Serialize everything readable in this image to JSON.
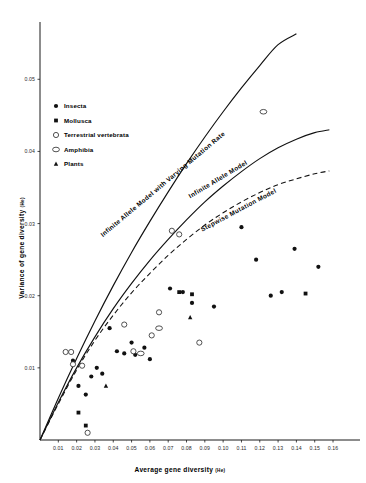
{
  "figure": {
    "background": "#ffffff",
    "ink": "#111111"
  },
  "chart_data": {
    "type": "scatter",
    "title": "",
    "xlabel": "Average gene diversity",
    "xlabel_sub": "(He)",
    "ylabel": "Variance of gene diversity",
    "ylabel_sub": "(He)",
    "xlim": [
      0.0,
      0.172
    ],
    "ylim": [
      0.0,
      0.056
    ],
    "grid": false,
    "xticks": [
      "0.01",
      "0.02",
      "0.03",
      "0.04",
      "0.05",
      "0.06",
      "0.07",
      "0.08",
      "0.09",
      "0.10",
      "0.11",
      "0.12",
      "0.13",
      "0.14",
      "0.15",
      "0.16"
    ],
    "xtick_values": [
      0.01,
      0.02,
      0.03,
      0.04,
      0.05,
      0.06,
      0.07,
      0.08,
      0.09,
      0.1,
      0.11,
      0.12,
      0.13,
      0.14,
      0.15,
      0.16
    ],
    "yticks": [
      "0.01",
      "0.02",
      "0.03",
      "0.04",
      "0.05"
    ],
    "ytick_values": [
      0.01,
      0.02,
      0.03,
      0.04,
      0.05
    ],
    "legend_position": "upper-left",
    "legend": [
      {
        "label": "Insecta",
        "marker": "filled-circle"
      },
      {
        "label": "Mollusca",
        "marker": "filled-square"
      },
      {
        "label": "Terrestrial vertebrata",
        "marker": "open-circle"
      },
      {
        "label": "Amphibia",
        "marker": "open-ellipse"
      },
      {
        "label": "Plants",
        "marker": "filled-triangle"
      }
    ],
    "series": [
      {
        "name": "Insecta",
        "marker": "filled-circle",
        "points": [
          [
            0.018,
            0.011
          ],
          [
            0.021,
            0.0075
          ],
          [
            0.025,
            0.0063
          ],
          [
            0.028,
            0.0088
          ],
          [
            0.031,
            0.01
          ],
          [
            0.034,
            0.0092
          ],
          [
            0.038,
            0.0155
          ],
          [
            0.042,
            0.0123
          ],
          [
            0.046,
            0.012
          ],
          [
            0.05,
            0.0135
          ],
          [
            0.052,
            0.0118
          ],
          [
            0.057,
            0.0128
          ],
          [
            0.06,
            0.0112
          ],
          [
            0.071,
            0.021
          ],
          [
            0.078,
            0.0205
          ],
          [
            0.083,
            0.019
          ],
          [
            0.095,
            0.0185
          ],
          [
            0.11,
            0.0295
          ],
          [
            0.118,
            0.025
          ],
          [
            0.126,
            0.02
          ],
          [
            0.132,
            0.0205
          ],
          [
            0.139,
            0.0265
          ],
          [
            0.152,
            0.024
          ]
        ]
      },
      {
        "name": "Mollusca",
        "marker": "filled-square",
        "points": [
          [
            0.021,
            0.0038
          ],
          [
            0.025,
            0.002
          ],
          [
            0.076,
            0.0205
          ],
          [
            0.083,
            0.0202
          ],
          [
            0.145,
            0.0203
          ]
        ]
      },
      {
        "name": "Terrestrial vertebrata",
        "marker": "open-circle",
        "points": [
          [
            0.014,
            0.0122
          ],
          [
            0.017,
            0.0122
          ],
          [
            0.018,
            0.0105
          ],
          [
            0.023,
            0.0103
          ],
          [
            0.026,
            0.001
          ],
          [
            0.046,
            0.016
          ],
          [
            0.051,
            0.0123
          ],
          [
            0.061,
            0.0145
          ],
          [
            0.065,
            0.0177
          ],
          [
            0.072,
            0.029
          ],
          [
            0.076,
            0.0285
          ],
          [
            0.087,
            0.0135
          ]
        ]
      },
      {
        "name": "Amphibia",
        "marker": "open-ellipse",
        "points": [
          [
            0.055,
            0.012
          ],
          [
            0.065,
            0.0155
          ],
          [
            0.122,
            0.0455
          ]
        ]
      },
      {
        "name": "Plants",
        "marker": "filled-triangle",
        "points": [
          [
            0.036,
            0.0075
          ],
          [
            0.082,
            0.017
          ]
        ]
      }
    ],
    "curves": [
      {
        "name": "Infinite Allele Model with Varying Mutation Rate",
        "style": "solid",
        "label_rotation": -40,
        "points": [
          [
            0.0,
            0.0
          ],
          [
            0.01,
            0.0058
          ],
          [
            0.02,
            0.0113
          ],
          [
            0.03,
            0.0165
          ],
          [
            0.04,
            0.0214
          ],
          [
            0.05,
            0.026
          ],
          [
            0.06,
            0.0303
          ],
          [
            0.07,
            0.0344
          ],
          [
            0.08,
            0.0383
          ],
          [
            0.09,
            0.042
          ],
          [
            0.1,
            0.0455
          ],
          [
            0.11,
            0.0488
          ],
          [
            0.12,
            0.0519
          ],
          [
            0.13,
            0.0548
          ],
          [
            0.14,
            0.0563
          ]
        ]
      },
      {
        "name": "Infinite Allele Model",
        "style": "solid",
        "label_rotation": -31,
        "points": [
          [
            0.0,
            0.0
          ],
          [
            0.01,
            0.0052
          ],
          [
            0.02,
            0.01
          ],
          [
            0.03,
            0.0143
          ],
          [
            0.04,
            0.0182
          ],
          [
            0.05,
            0.0217
          ],
          [
            0.06,
            0.0249
          ],
          [
            0.07,
            0.0278
          ],
          [
            0.08,
            0.0305
          ],
          [
            0.09,
            0.033
          ],
          [
            0.1,
            0.0352
          ],
          [
            0.11,
            0.0372
          ],
          [
            0.12,
            0.039
          ],
          [
            0.13,
            0.0405
          ],
          [
            0.14,
            0.0417
          ],
          [
            0.15,
            0.0426
          ],
          [
            0.158,
            0.043
          ]
        ]
      },
      {
        "name": "Stepwise Mutation Model",
        "style": "dashed",
        "label_rotation": -28,
        "points": [
          [
            0.0,
            0.0
          ],
          [
            0.01,
            0.005
          ],
          [
            0.02,
            0.0097
          ],
          [
            0.03,
            0.0138
          ],
          [
            0.04,
            0.0173
          ],
          [
            0.05,
            0.0204
          ],
          [
            0.06,
            0.0231
          ],
          [
            0.07,
            0.0256
          ],
          [
            0.08,
            0.0278
          ],
          [
            0.09,
            0.0298
          ],
          [
            0.1,
            0.0315
          ],
          [
            0.11,
            0.033
          ],
          [
            0.12,
            0.0343
          ],
          [
            0.13,
            0.0354
          ],
          [
            0.14,
            0.0362
          ],
          [
            0.15,
            0.0369
          ],
          [
            0.158,
            0.0373
          ]
        ]
      }
    ]
  }
}
